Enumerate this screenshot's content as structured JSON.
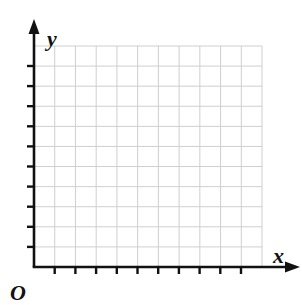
{
  "figure": {
    "kind": "blank-coordinate-grid",
    "background_color": "#ffffff",
    "width": 302,
    "height": 305
  },
  "labels": {
    "y_axis": "y",
    "x_axis": "x",
    "origin": "O"
  },
  "axes": {
    "color": "#111111",
    "line_width": 2.6,
    "tick_length": 7,
    "tick_width": 2.4,
    "x_axis": {
      "y_position": 267,
      "start_x": 34,
      "end_x": 292,
      "arrow": "right",
      "tick_count": 10,
      "tick_spacing": 20.7,
      "first_tick_x": 54.7
    },
    "y_axis": {
      "x_position": 34,
      "start_y": 267,
      "end_y": 27,
      "arrow": "up",
      "tick_count": 10,
      "tick_spacing": 20.1,
      "first_tick_y": 246.9
    }
  },
  "grid": {
    "color": "#cfcfcf",
    "line_width": 1,
    "left": 34,
    "top": 46,
    "right": 262,
    "bottom": 267,
    "columns": 11,
    "rows": 11,
    "cell_width": 20.73,
    "cell_height": 20.09
  },
  "chart_data": {
    "type": "scatter",
    "title": "",
    "xlabel": "x",
    "ylabel": "y",
    "series": [],
    "x": [],
    "values": [],
    "categories": [],
    "xlim": [
      0,
      11
    ],
    "ylim": [
      0,
      11
    ],
    "grid": true,
    "legend": "none",
    "annotations": [
      "O"
    ],
    "note": "Empty first-quadrant coordinate grid with no plotted data; 11 by 11 unit squares, 10 tick marks on each axis."
  }
}
